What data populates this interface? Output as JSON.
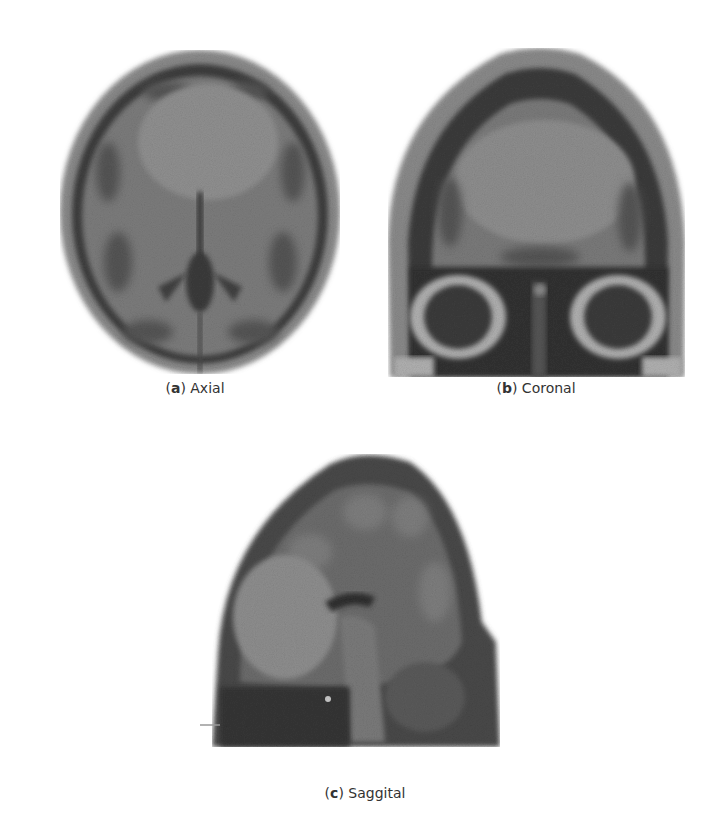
{
  "figure": {
    "panels": [
      {
        "id": "a",
        "letter": "a",
        "label": "Axial",
        "view": "axial-mri-slice"
      },
      {
        "id": "b",
        "letter": "b",
        "label": "Coronal",
        "view": "coronal-mri-slice"
      },
      {
        "id": "c",
        "letter": "c",
        "label": "Saggital",
        "view": "sagittal-mri-slice"
      }
    ]
  },
  "colors": {
    "background": "#ffffff",
    "scalp": "#8a8a8a",
    "skull": "#3e3e3e",
    "brain": "#7a7a7a",
    "tumor": "#8f8f8f",
    "dark_tissue": "#2e2e2e",
    "light_tissue": "#b5b5b5"
  }
}
